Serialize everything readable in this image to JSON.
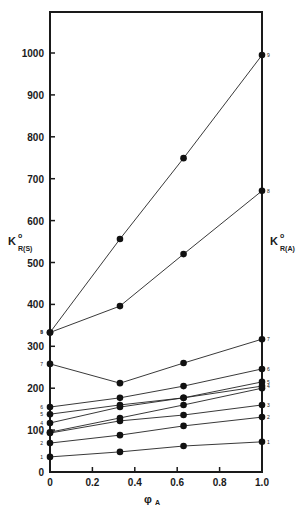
{
  "chart_data": {
    "type": "line",
    "title": "",
    "xlabel": "φA",
    "ylabel_left": "K°R(S)",
    "ylabel_right": "K°R(A)",
    "xlim": [
      0,
      1.0
    ],
    "ylim": [
      0,
      1000
    ],
    "x_ticks": [
      "0",
      "0.2",
      "0.4",
      "0.6",
      "0.8",
      "1.0"
    ],
    "y_ticks": [
      "0",
      "100",
      "200",
      "300",
      "400",
      "500",
      "600",
      "700",
      "800",
      "900",
      "1000"
    ],
    "grid": false,
    "legend": "curve numbers at line ends",
    "x": [
      0,
      0.33,
      0.63,
      1.0
    ],
    "series": [
      {
        "name": "1",
        "values": [
          36,
          48,
          62,
          72
        ]
      },
      {
        "name": "2",
        "values": [
          69,
          88,
          110,
          131
        ]
      },
      {
        "name": "3",
        "values": [
          93,
          122,
          136,
          160
        ]
      },
      {
        "name": "3b",
        "values": [
          95,
          129,
          160,
          200
        ]
      },
      {
        "name": "4",
        "values": [
          117,
          155,
          177,
          205
        ]
      },
      {
        "name": "5",
        "values": [
          138,
          160,
          177,
          215
        ]
      },
      {
        "name": "6",
        "values": [
          155,
          177,
          205,
          246
        ]
      },
      {
        "name": "7",
        "values": [
          258,
          212,
          260,
          317
        ]
      },
      {
        "name": "8",
        "values": [
          333,
          396,
          520,
          671
        ]
      },
      {
        "name": "9",
        "values": [
          333,
          556,
          749,
          995
        ]
      }
    ],
    "fix_note": ""
  }
}
